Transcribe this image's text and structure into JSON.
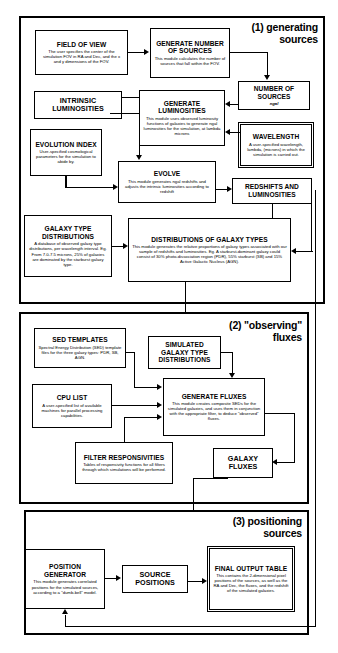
{
  "figure": {
    "type": "flowchart"
  },
  "sections": [
    {
      "id": "s1",
      "label": "(1) generating\nsources",
      "line1": "(1) generating",
      "line2": "sources"
    },
    {
      "id": "s2",
      "label": "(2) \"observing\"\nfluxes",
      "line1": "(2) \"observing\"",
      "line2": "fluxes"
    },
    {
      "id": "s3",
      "label": "(3) positioning\nsources",
      "line1": "(3) positioning",
      "line2": "sources"
    }
  ],
  "boxes": {
    "field_of_view": {
      "title": "FIELD OF VIEW",
      "desc": "The user specifies the center of the simulation FOV in RA and Dec, and the x and y dimensions of the FOV."
    },
    "generate_number_of_sources": {
      "title": "GENERATE NUMBER OF SOURCES",
      "desc": "This module calculates the number of sources that fall within the FOV."
    },
    "number_of_sources": {
      "title": "NUMBER OF SOURCES",
      "sub": "ngal"
    },
    "intrinsic_luminosities": {
      "title": "INTRINSIC LUMINOSITIES"
    },
    "generate_luminosities": {
      "title": "GENERATE LUMINOSITIES",
      "desc": "This module uses observed luminosity functions of galaxies to generate ngal luminosities for the simulation, at lambda microns"
    },
    "wavelength": {
      "title": "WAVELENGTH",
      "desc": "A user-specified wavelength, lambda, (microns) in which the simulation is carried out."
    },
    "evolution_index": {
      "title": "EVOLUTION INDEX",
      "desc": "User-specified cosmological parameters for the simulation to abide by."
    },
    "evolve": {
      "title": "EVOLVE",
      "desc": "This module generates ngal redshifts and adjusts the intrinsic luminosities according to redshift"
    },
    "redshifts_and_luminosities": {
      "title": "REDSHIFTS AND LUMINOSITIES"
    },
    "galaxy_type_distributions": {
      "title": "GALAXY TYPE DISTRIBUTIONS",
      "desc": "A database of observed galaxy type distributions, per wavelength interval. Eg. From 7.0-7.5 microns, 25% of galaxies are dominated by the starburst galaxy type."
    },
    "distributions_of_galaxy_types": {
      "title": "DISTRIBUTIONS OF GALAXY TYPES",
      "desc": "This module generates the relative proportions of galaxy types associated with our sample of redshifts and luminosities. Eg. A starburst-dominant galaxy could consist of 30% photo-dissociation region (PDR), 55% starburst (SB) and 15% Active Galactic Nucleus (AGN)."
    },
    "sed_templates": {
      "title": "SED  TEMPLATES",
      "desc": "Spectral Energy Distribution (SED) template files for the three galaxy types: PDR, SB, AGN."
    },
    "simulated_galaxy_type_distributions": {
      "title": "SIMULATED GALAXY TYPE DISTRIBUTIONS"
    },
    "cpu_list": {
      "title": "CPU LIST",
      "desc": "A user-specified list of available machines for parallel processing capabilities."
    },
    "generate_fluxes": {
      "title": "GENERATE FLUXES",
      "desc": "This module creates composite SEDs for the simulated galaxies, and uses them in conjunction with the appropriate filter, to deduce \"observed\" fluxes."
    },
    "filter_responsivities": {
      "title": "FILTER RESPONSIVITIES",
      "desc": "Tables of responsivity functions for all filters through which simulations will be performed."
    },
    "galaxy_fluxes": {
      "title": "GALAXY FLUXES"
    },
    "position_generator": {
      "title": "POSITION GENERATOR",
      "desc": "This module generates correlated positions for the simulated sources, according to a \"dumb-bell\" model."
    },
    "source_positions": {
      "title": "SOURCE POSITIONS"
    },
    "final_output_table": {
      "title": "FINAL OUTPUT TABLE",
      "desc": "This contains the 2-dimensional pixel positions of the sources, as well as the RA and Dec, the fluxes, and the redshift of the simulated galaxies."
    }
  },
  "colors": {
    "stroke": "#000000",
    "background": "#ffffff"
  }
}
